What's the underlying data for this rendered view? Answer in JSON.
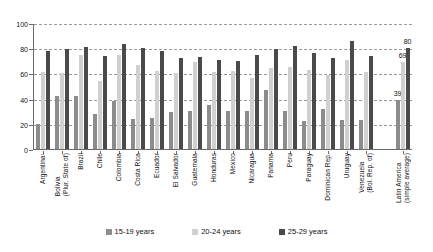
{
  "chart_data": {
    "type": "bar",
    "title": "",
    "subtitle": "",
    "xlabel": "",
    "ylabel": "",
    "ylim": [
      0,
      100
    ],
    "yticks": [
      0,
      20,
      40,
      60,
      80,
      100
    ],
    "grid": true,
    "legend_position": "bottom",
    "categories": [
      "Argentina¹",
      "Bolivia\n(Plur. State of)",
      "Brazil",
      "Chile",
      "Colombia",
      "Costa Rica",
      "Ecuador",
      "El Salvador",
      "Guatemala",
      "Honduras",
      "Mexico",
      "Nicaragua",
      "Panama",
      "Peru",
      "Paraguay",
      "Dominican Rep.",
      "Uruguay",
      "Venezuela\n(Bol. Rep. of)",
      "Latin America\n(simple average)"
    ],
    "series": [
      {
        "name": "15-19 years",
        "color": "#8c8c8c",
        "values": [
          20,
          42,
          42,
          28,
          38,
          24,
          25,
          29,
          30,
          35,
          30,
          30,
          47,
          30,
          22,
          32,
          23,
          23,
          39
        ]
      },
      {
        "name": "20-24 years",
        "color": "#d0d0d0",
        "values": [
          61,
          60,
          75,
          54,
          75,
          67,
          62,
          60,
          69,
          61,
          62,
          56,
          64,
          65,
          63,
          59,
          71,
          61,
          69
        ]
      },
      {
        "name": "25-29 years",
        "color": "#4a4a4a",
        "values": [
          78,
          79,
          81,
          74,
          83,
          80,
          78,
          72,
          73,
          71,
          70,
          75,
          79,
          82,
          76,
          72,
          86,
          74,
          80
        ]
      }
    ],
    "data_labels": {
      "last_group_index": 18,
      "labels": [
        "39",
        "69",
        "80"
      ]
    }
  },
  "legend": {
    "items": [
      {
        "label": "15-19 years",
        "color": "#8c8c8c",
        "swatch": "legend-swatch-15-19"
      },
      {
        "label": "20-24 years",
        "color": "#d0d0d0",
        "swatch": "legend-swatch-20-24"
      },
      {
        "label": "25-29 years",
        "color": "#4a4a4a",
        "swatch": "legend-swatch-25-29"
      }
    ]
  }
}
